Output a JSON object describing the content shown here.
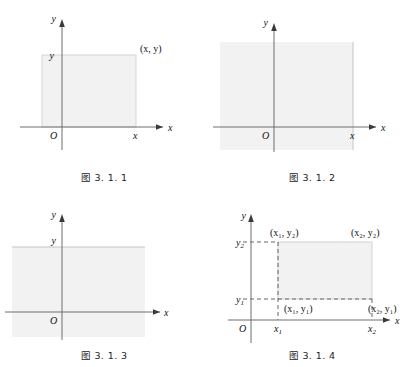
{
  "page": {
    "background": "#ffffff",
    "axis_color": "#6e6e6e",
    "region_fill": "#f2f2f2",
    "region_stroke": "#c9c9c9",
    "dash_color": "#555555",
    "text_color": "#111111"
  },
  "figures": [
    {
      "id": "fig-3-1-1",
      "caption": "图 3. 1. 1",
      "description": "quadrant rectangle region bounded by x and y",
      "axis_x_label": "x",
      "axis_y_label": "y",
      "origin_label": "O",
      "tick_x_label": "x",
      "tick_y_label": "y",
      "corner_label": "(x, y)",
      "region_type": "rectangle"
    },
    {
      "id": "fig-3-1-2",
      "caption": "图 3. 1. 2",
      "description": "vertical half-strip left of the line x",
      "axis_x_label": "x",
      "axis_y_label": "y",
      "origin_label": "O",
      "tick_x_label": "x",
      "region_type": "vertical-strip"
    },
    {
      "id": "fig-3-1-3",
      "caption": "图 3. 1. 3",
      "description": "horizontal half-strip below the line y",
      "axis_x_label": "x",
      "axis_y_label": "y",
      "origin_label": "O",
      "tick_y_label": "y",
      "region_type": "horizontal-strip"
    },
    {
      "id": "fig-3-1-4",
      "caption": "图 3. 1. 4",
      "description": "rectangle with four labelled corners",
      "axis_x_label": "x",
      "axis_y_label": "y",
      "origin_label": "O",
      "tick_x1_label": "x",
      "tick_x1_sub": "1",
      "tick_x2_label": "x",
      "tick_x2_sub": "2",
      "tick_y1_label": "y",
      "tick_y1_sub": "1",
      "tick_y2_label": "y",
      "tick_y2_sub": "2",
      "corner_top_left": "(x₁, y₂)",
      "corner_top_right": "(x₂, y₂)",
      "corner_bottom_left": "(x₁, y₁)",
      "corner_bottom_right": "(x₂, y₁)",
      "region_type": "rectangle"
    }
  ]
}
